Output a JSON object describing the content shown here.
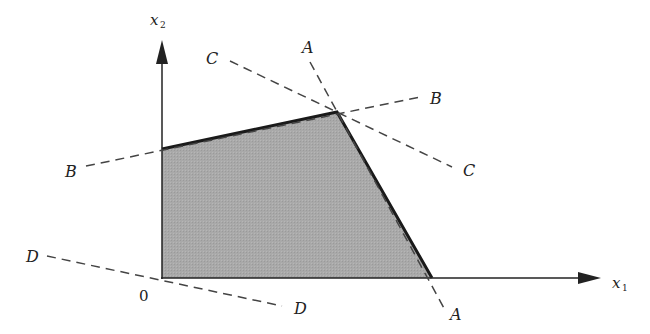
{
  "diagram": {
    "axes": {
      "x_label": "x",
      "x_sub": "1",
      "y_label": "x",
      "y_sub": "2",
      "origin_label": "0"
    },
    "constraint_lines": [
      {
        "name": "A",
        "label_start": "A",
        "label_end": "A"
      },
      {
        "name": "B",
        "label_start": "B",
        "label_end": "B"
      },
      {
        "name": "C",
        "label_start": "C",
        "label_end": "C"
      },
      {
        "name": "D",
        "label_start": "D",
        "label_end": "D"
      }
    ],
    "feasible_region": {
      "vertices": [
        [
          162,
          278
        ],
        [
          162,
          149
        ],
        [
          337,
          112
        ],
        [
          432,
          278
        ]
      ],
      "fill": "#a8a8a8",
      "edge_color": "#1a1a1a"
    },
    "colors": {
      "axis": "#222222",
      "dashed": "#444444",
      "region": "#a8a8a8"
    }
  }
}
